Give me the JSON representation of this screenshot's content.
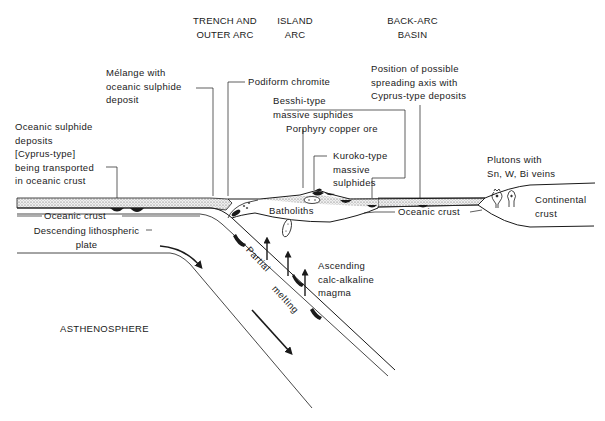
{
  "headers": {
    "trench": "TRENCH AND\nOUTER ARC",
    "island_arc": "ISLAND\nARC",
    "back_arc": "BACK-ARC\nBASIN"
  },
  "labels": {
    "melange": "Mélange with\noceanic sulphide\ndeposit",
    "podiform": "Podiform chromite",
    "position_axis": "Position of possible\nspreading axis with\nCyprus-type deposits",
    "besshi": "Besshi-type\nmassive suphides",
    "porphyry": "Porphyry copper ore",
    "kuroko": "Kuroko-type\nmassive\nsulphides",
    "oceanic_sulphide": "Oceanic sulphide\ndeposits\n[Cyprus-type]\nbeing transported\nin oceanic crust",
    "oceanic_crust_left": "Oceanic crust",
    "oceanic_crust_right": "Oceanic crust",
    "descending": "Descending lithospheric\nplate",
    "batholiths": "Batholiths",
    "plutons": "Plutons with\nSn, W, Bi veins",
    "continental": "Continental\ncrust",
    "ascending": "Ascending\ncalc-alkaline\nmagma",
    "partial": "Partial",
    "melting": "melting",
    "asthenosphere": "ASTHENOSPHERE"
  },
  "colors": {
    "line": "#1a1a1a",
    "fill_dots": "#d8d8d8",
    "background": "#ffffff"
  }
}
